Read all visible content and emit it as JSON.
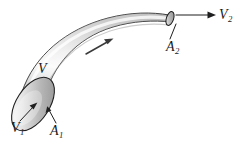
{
  "figure": {
    "kind": "stream-tube-flow-diagram",
    "background_color": "#ffffff",
    "outline_color": "#1b1b1b",
    "tube_fill_light": "#fdfdfd",
    "tube_fill_mid": "#c9c9c9",
    "tube_fill_dark": "#9a9a9a",
    "inlet_face_light": "#f2f2f2",
    "inlet_face_dark": "#a8a8a8",
    "labels": {
      "volume": "V",
      "inlet_velocity": "V",
      "inlet_velocity_sub": "1",
      "inlet_area": "A",
      "inlet_area_sub": "1",
      "outlet_area": "A",
      "outlet_area_sub": "2",
      "outlet_velocity": "V",
      "outlet_velocity_sub": "2"
    }
  }
}
